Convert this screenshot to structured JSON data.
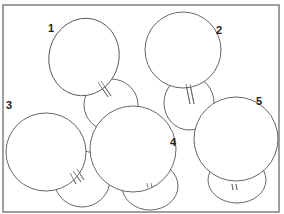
{
  "figure": {
    "frame": {
      "x": 3,
      "y": 5,
      "width": 276,
      "height": 207,
      "stroke": "#888888"
    },
    "line_color": "#555555",
    "items": [
      {
        "label": "1",
        "label_pos": [
          48,
          32
        ],
        "large": {
          "cx": 84,
          "cy": 57,
          "rx": 35,
          "ry": 39,
          "rot": 15
        },
        "small": {
          "cx": 111,
          "cy": 105,
          "rx": 27,
          "ry": 26
        },
        "marks": [
          [
            98,
            82,
            108,
            97
          ],
          [
            101,
            81,
            111,
            96
          ]
        ]
      },
      {
        "label": "2",
        "label_pos": [
          216,
          34
        ],
        "large": {
          "cx": 183,
          "cy": 50,
          "rx": 38,
          "ry": 38,
          "rot": 0
        },
        "small": {
          "cx": 189,
          "cy": 103,
          "rx": 25,
          "ry": 27
        },
        "marks": [
          [
            186,
            84,
            190,
            104
          ],
          [
            190,
            84,
            194,
            104
          ]
        ]
      },
      {
        "label": "3",
        "label_pos": [
          6,
          109
        ],
        "large": {
          "cx": 46,
          "cy": 152,
          "rx": 40,
          "ry": 39,
          "rot": 0
        },
        "small": {
          "cx": 82,
          "cy": 179,
          "rx": 28,
          "ry": 28
        },
        "marks": [
          [
            70,
            173,
            76,
            184
          ],
          [
            73,
            171,
            81,
            182
          ],
          [
            77,
            169,
            84,
            180
          ]
        ]
      },
      {
        "label": "4",
        "label_pos": [
          170,
          146
        ],
        "large": {
          "cx": 133,
          "cy": 149,
          "rx": 43,
          "ry": 43,
          "rot": 0
        },
        "small": {
          "cx": 150,
          "cy": 186,
          "rx": 28,
          "ry": 24
        },
        "marks": [
          [
            147,
            183,
            148,
            188
          ],
          [
            151,
            183,
            152,
            188
          ]
        ]
      },
      {
        "label": "5",
        "label_pos": [
          256,
          105
        ],
        "large": {
          "cx": 236,
          "cy": 139,
          "rx": 42,
          "ry": 42,
          "rot": 0
        },
        "small": {
          "cx": 237,
          "cy": 180,
          "rx": 29,
          "ry": 23
        },
        "marks": [
          [
            232,
            184,
            233,
            190
          ],
          [
            236,
            184,
            237,
            190
          ]
        ]
      }
    ]
  }
}
